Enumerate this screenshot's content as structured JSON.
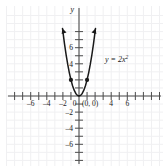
{
  "chart_data": {
    "type": "line",
    "title": "",
    "equation_label": "y = 2x²",
    "function": "y = 2x^2",
    "xlabel": "",
    "ylabel": "y",
    "xlim": [
      -7.6,
      7.6
    ],
    "ylim": [
      -7.6,
      8.4
    ],
    "grid": true,
    "legend": "none",
    "x_ticks": [
      -6,
      -4,
      -2,
      0,
      4,
      6
    ],
    "x_tick_labels": [
      "-6",
      "-4",
      "-2",
      "0",
      "4",
      "6"
    ],
    "y_ticks": [
      6,
      4,
      -2,
      -4,
      -6
    ],
    "y_tick_labels": [
      "6",
      "4",
      "-2",
      "-4",
      "-6"
    ],
    "x": [
      -2.05,
      -1.8,
      -1.6,
      -1.4,
      -1.2,
      -1.0,
      -0.8,
      -0.6,
      -0.4,
      -0.2,
      0,
      0.2,
      0.4,
      0.6,
      0.8,
      1.0,
      1.2,
      1.4,
      1.6,
      1.8,
      2.05
    ],
    "values": [
      8.4,
      6.48,
      5.12,
      3.92,
      2.88,
      2.0,
      1.28,
      0.72,
      0.32,
      0.08,
      0,
      0.08,
      0.32,
      0.72,
      1.28,
      2.0,
      2.88,
      3.92,
      5.12,
      6.48,
      8.4
    ],
    "marked_points": [
      {
        "x": -1,
        "y": 2,
        "label": ""
      },
      {
        "x": 1,
        "y": 2,
        "label": ""
      },
      {
        "x": 0,
        "y": 0,
        "label": "(0, 0)"
      }
    ],
    "vertex_label": "(0, 0)",
    "arrows": [
      "left-branch-up",
      "right-branch-up"
    ],
    "curve_color": "#1a1a1a",
    "grid_color": "#f0f0f2",
    "axis_color": "#4d4d4d"
  },
  "axis_names": {
    "y": "y"
  }
}
